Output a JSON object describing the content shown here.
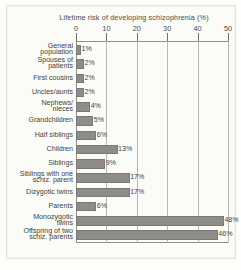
{
  "chart_data": {
    "type": "bar",
    "orientation": "horizontal",
    "title": "Lifetime risk of  developing schizophrenia (%)",
    "xlabel": "",
    "ylabel": "",
    "xlim": [
      0,
      50
    ],
    "xticks": [
      0,
      10,
      20,
      30,
      40,
      50
    ],
    "xtick_labels": [
      "0",
      "10",
      "20",
      "30",
      "40",
      "50"
    ],
    "grid": true,
    "axis_position": "top",
    "legend": "none",
    "value_label_suffix": "%",
    "categories": [
      "General\npopulation",
      "Spouses of\npatients",
      "First cousins",
      "Uncles/aunts",
      "Nephews/\nnieces",
      "Grandchildren",
      "Half siblings",
      "Children",
      "Siblings",
      "Siblings with one\nschiz. parent",
      "Dizygotic twins",
      "Parents",
      "Monozygotic\ntwins",
      "Offspring of two\nschiz. parents"
    ],
    "values": [
      1,
      2,
      2,
      2,
      4,
      5,
      6,
      13,
      9,
      17,
      17,
      6,
      48,
      46
    ],
    "value_labels": [
      "1%",
      "2%",
      "2%",
      "2%",
      "4%",
      "5%",
      "6%",
      "13%",
      "9%",
      "17%",
      "17%",
      "6%",
      "48%",
      "46%"
    ],
    "colors": {
      "bar_fill": "#8d8c88",
      "bar_stroke": "#7a7975",
      "grid": "#b9b8b3",
      "axis": "#8f8e89",
      "text": "#3f3f3d",
      "background": "#fbfbf8"
    }
  }
}
